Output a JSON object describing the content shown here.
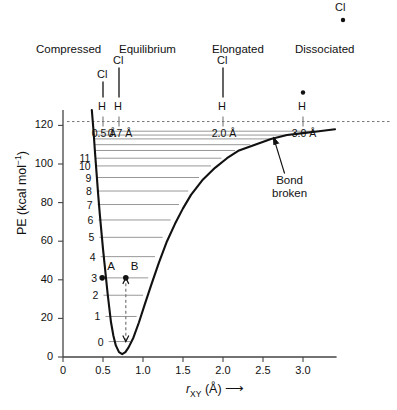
{
  "chart_data": {
    "type": "line",
    "xlabel": "r_XY (A)",
    "ylabel": "PE (kcal mol^-1)",
    "xlim": [
      0,
      3.4
    ],
    "ylim": [
      0,
      128
    ],
    "xticks": [
      "0",
      "0.5",
      "1.0",
      "1.5",
      "2.0",
      "2.5",
      "3.0"
    ],
    "xtick_values": [
      0,
      0.5,
      1.0,
      1.5,
      2.0,
      2.5,
      3.0
    ],
    "yticks": [
      "0",
      "20",
      "40",
      "60",
      "80",
      "100",
      "120"
    ],
    "ytick_values": [
      0,
      20,
      40,
      60,
      80,
      100,
      120
    ],
    "grid": false,
    "legend": "none",
    "curve_name": "Morse potential",
    "dissociation_energy": 118,
    "minimum_point": {
      "r": 0.7,
      "pe": 2
    },
    "curve_points": [
      [
        0.36,
        128
      ],
      [
        0.38,
        118
      ],
      [
        0.4,
        106
      ],
      [
        0.42,
        95
      ],
      [
        0.44,
        84
      ],
      [
        0.46,
        74
      ],
      [
        0.48,
        65
      ],
      [
        0.5,
        56
      ],
      [
        0.52,
        48
      ],
      [
        0.54,
        40
      ],
      [
        0.56,
        32
      ],
      [
        0.58,
        25
      ],
      [
        0.6,
        18
      ],
      [
        0.63,
        11
      ],
      [
        0.66,
        6
      ],
      [
        0.7,
        2.5
      ],
      [
        0.74,
        1.5
      ],
      [
        0.78,
        2.5
      ],
      [
        0.82,
        5
      ],
      [
        0.88,
        10
      ],
      [
        0.95,
        18
      ],
      [
        1.02,
        27
      ],
      [
        1.1,
        37
      ],
      [
        1.2,
        49
      ],
      [
        1.3,
        60
      ],
      [
        1.4,
        69
      ],
      [
        1.5,
        77
      ],
      [
        1.6,
        84
      ],
      [
        1.75,
        92
      ],
      [
        1.9,
        98
      ],
      [
        2.05,
        103
      ],
      [
        2.2,
        107
      ],
      [
        2.4,
        110
      ],
      [
        2.6,
        113
      ],
      [
        2.8,
        115
      ],
      [
        3.0,
        116
      ],
      [
        3.2,
        117
      ],
      [
        3.4,
        118
      ]
    ],
    "vibrational_levels": [
      {
        "v": "0",
        "pe": 8,
        "r_left": 0.57,
        "r_right": 0.84
      },
      {
        "v": "1",
        "pe": 21,
        "r_left": 0.53,
        "r_right": 0.92
      },
      {
        "v": "2",
        "pe": 32,
        "r_left": 0.505,
        "r_right": 1.0
      },
      {
        "v": "3",
        "pe": 41,
        "r_left": 0.49,
        "r_right": 1.065
      },
      {
        "v": "4",
        "pe": 52,
        "r_left": 0.47,
        "r_right": 1.15
      },
      {
        "v": "5",
        "pe": 62,
        "r_left": 0.455,
        "r_right": 1.245
      },
      {
        "v": "6",
        "pe": 71,
        "r_left": 0.443,
        "r_right": 1.345
      },
      {
        "v": "7",
        "pe": 79,
        "r_left": 0.433,
        "r_right": 1.45
      },
      {
        "v": "8",
        "pe": 86,
        "r_left": 0.424,
        "r_right": 1.565
      },
      {
        "v": "9",
        "pe": 93,
        "r_left": 0.416,
        "r_right": 1.7
      },
      {
        "v": "10",
        "pe": 99,
        "r_left": 0.409,
        "r_right": 1.85
      },
      {
        "v": "11",
        "pe": 103,
        "r_left": 0.404,
        "r_right": 1.98
      },
      {
        "v": "",
        "pe": 107,
        "r_left": 0.399,
        "r_right": 2.15
      },
      {
        "v": "",
        "pe": 110,
        "r_left": 0.394,
        "r_right": 2.34
      },
      {
        "v": "",
        "pe": 113,
        "r_left": 0.389,
        "r_right": 2.6
      },
      {
        "v": "",
        "pe": 115,
        "r_left": 0.385,
        "r_right": 2.84
      },
      {
        "v": "",
        "pe": 117,
        "r_left": 0.381,
        "r_right": 3.15
      }
    ],
    "marked_points": [
      {
        "label": "A",
        "r": 0.49,
        "pe": 41
      },
      {
        "label": "B",
        "r": 0.785,
        "pe": 41
      }
    ],
    "transition_arrow": {
      "r": 0.785,
      "pe_from": 41,
      "pe_to": 8
    },
    "dissociation_line_pe": 122,
    "annotations": [
      {
        "text": "Bond broken",
        "r": 2.82,
        "pe": 93,
        "points_to_r": 2.63,
        "points_to_pe": 114
      }
    ]
  },
  "states": [
    {
      "name": "Compressed",
      "r": 0.5
    },
    {
      "name": "Equilibrium",
      "r": 0.7
    },
    {
      "name": "Elongated",
      "r": 2.0
    },
    {
      "name": "Dissociated",
      "r": 3.0
    }
  ],
  "molecules": [
    {
      "top_atom": "Cl",
      "bottom_atom": "H",
      "distance": "0.5 Å",
      "r": 0.5,
      "bonded": true,
      "bond_length_px": 18
    },
    {
      "top_atom": "Cl",
      "bottom_atom": "H",
      "distance": "0.7 Å",
      "r": 0.7,
      "bonded": true,
      "bond_length_px": 32
    },
    {
      "top_atom": "Cl",
      "bottom_atom": "H",
      "distance": "2.0 Å",
      "r": 2.0,
      "bonded": true,
      "bond_length_px": 32
    },
    {
      "top_atom": "Cl",
      "bottom_atom": "H",
      "distance": "3.0 Å",
      "r": 3.0,
      "bonded": false,
      "bond_length_px": 0
    }
  ],
  "axis": {
    "y_title_main": "PE (kcal mol",
    "y_title_sup": "−1",
    "y_title_end": ")",
    "x_title_var": "r",
    "x_title_sub": "XY",
    "x_title_unit": " (Å)",
    "x_title_arrow": "⟶"
  },
  "colors": {
    "curve": "#111111",
    "level_line": "#8c8c8c",
    "axis": "#444444",
    "dashed": "#777777",
    "text": "#111111"
  }
}
